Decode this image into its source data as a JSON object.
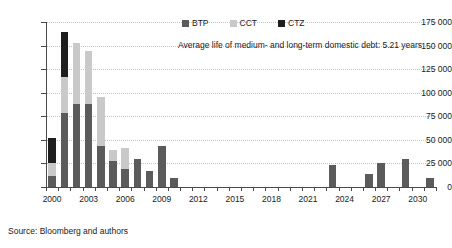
{
  "chart_data": {
    "type": "bar",
    "stacked": true,
    "title": "",
    "subtitle": "",
    "xlabel": "",
    "ylabel": "",
    "ylim": [
      0,
      175000
    ],
    "ytick_step": 25000,
    "ytick_labels": [
      "175 000",
      "150 000",
      "125 000",
      "100 000",
      "75 000",
      "50 000",
      "25 000",
      "0"
    ],
    "ytick_values": [
      175000,
      150000,
      125000,
      100000,
      75000,
      50000,
      25000,
      0
    ],
    "grid": true,
    "legend_position": "top-center",
    "legend": [
      "BTP",
      "CCT",
      "CTZ"
    ],
    "colors": {
      "BTP": "#5b5b5b",
      "CCT": "#c9c9c9",
      "CTZ": "#1e1e1e"
    },
    "categories": [
      "2000",
      "2001",
      "2002",
      "2003",
      "2004",
      "2005",
      "2006",
      "2007",
      "2008",
      "2009",
      "2010",
      "2011",
      "2012",
      "2013",
      "2014",
      "2015",
      "2016",
      "2017",
      "2018",
      "2019",
      "2020",
      "2021",
      "2022",
      "2023",
      "2024",
      "2025",
      "2026",
      "2027",
      "2028",
      "2029",
      "2030",
      "2031"
    ],
    "xtick_labels": [
      "2000",
      "2003",
      "2006",
      "2009",
      "2012",
      "2015",
      "2018",
      "2021",
      "2024",
      "2027",
      "2030"
    ],
    "series": [
      {
        "name": "BTP",
        "values": [
          12000,
          79000,
          88000,
          88000,
          44000,
          28000,
          19000,
          30000,
          17000,
          44000,
          10000,
          0,
          0,
          0,
          0,
          0,
          0,
          0,
          0,
          0,
          0,
          0,
          0,
          23000,
          0,
          0,
          14000,
          25000,
          0,
          30000,
          0,
          10000
        ]
      },
      {
        "name": "CCT",
        "values": [
          14000,
          38000,
          65000,
          56000,
          52000,
          11000,
          22000,
          0,
          0,
          0,
          0,
          0,
          0,
          0,
          0,
          0,
          0,
          0,
          0,
          0,
          0,
          0,
          0,
          0,
          0,
          0,
          0,
          0,
          0,
          0,
          0,
          0
        ]
      },
      {
        "name": "CTZ",
        "values": [
          26000,
          47000,
          0,
          0,
          0,
          0,
          0,
          0,
          0,
          0,
          0,
          0,
          0,
          0,
          0,
          0,
          0,
          0,
          0,
          0,
          0,
          0,
          0,
          0,
          0,
          0,
          0,
          0,
          0,
          0,
          0,
          0
        ]
      }
    ],
    "totals": [
      52000,
      164000,
      153000,
      144000,
      96000,
      39000,
      41000,
      30000,
      17000,
      44000,
      10000,
      0,
      0,
      0,
      0,
      0,
      0,
      0,
      0,
      0,
      0,
      0,
      0,
      23000,
      0,
      0,
      14000,
      25000,
      0,
      30000,
      0,
      10000
    ],
    "annotation": "Average life of medium- and long-term domestic debt: 5.21 years",
    "source": "Source: Bloomberg and authors"
  }
}
